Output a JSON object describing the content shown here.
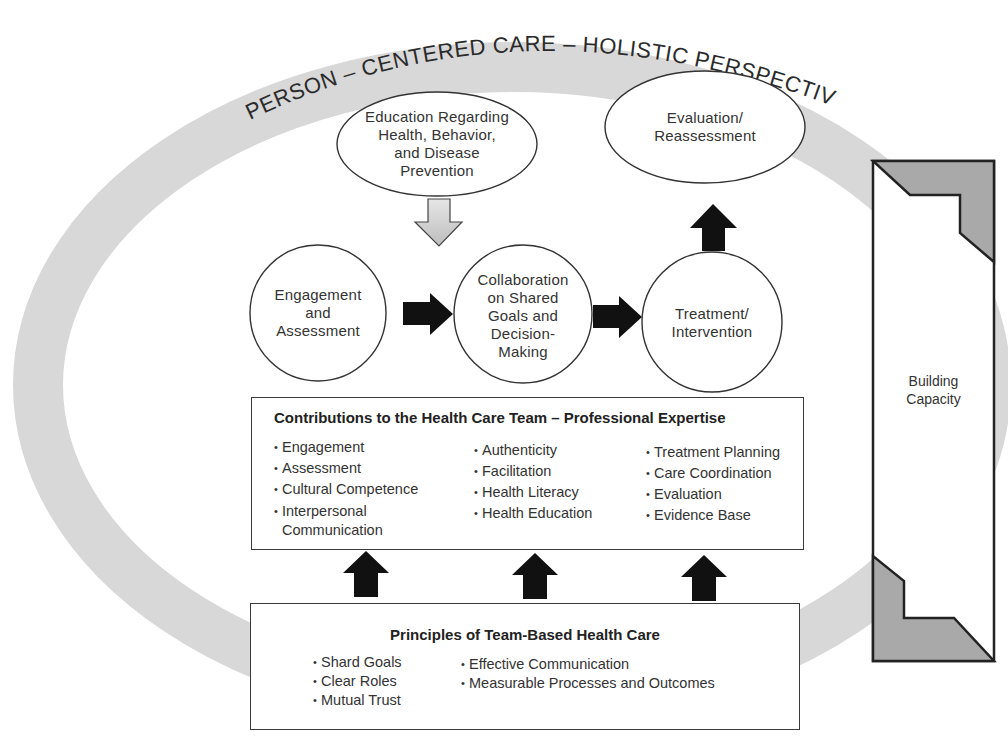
{
  "ring": {
    "label": "PERSON – CENTERED CARE – HOLISTIC PERSPECTIVE",
    "color": "#d6d6d6"
  },
  "nodes": {
    "education": {
      "lines": [
        "Education Regarding",
        "Health, Behavior,",
        "and Disease",
        "Prevention"
      ]
    },
    "evaluation": {
      "lines": [
        "Evaluation/",
        "Reassessment"
      ]
    },
    "engagement": {
      "lines": [
        "Engagement",
        "and",
        "Assessment"
      ]
    },
    "collaboration": {
      "lines": [
        "Collaboration",
        "on Shared",
        "Goals and",
        "Decision-",
        "Making"
      ]
    },
    "treatment": {
      "lines": [
        "Treatment/",
        "Intervention"
      ]
    }
  },
  "contributions": {
    "title": "Contributions to the Health Care Team – Professional Expertise",
    "columns": [
      [
        "Engagement",
        "Assessment",
        "Cultural Competence",
        "Interpersonal",
        "Communication"
      ],
      [
        "Authenticity",
        "Facilitation",
        "Health Literacy",
        "Health Education"
      ],
      [
        "Treatment Planning",
        "Care Coordination",
        "Evaluation",
        "Evidence Base"
      ]
    ]
  },
  "principles": {
    "title": "Principles of Team-Based Health Care",
    "columns": [
      [
        "Shard Goals",
        "Clear Roles",
        "Mutual Trust"
      ],
      [
        "Effective Communication",
        "Measurable Processes and Outcomes"
      ]
    ]
  },
  "capacity": {
    "lines": [
      "Building",
      "Capacity"
    ],
    "fill_color": "#a9a9a9"
  },
  "colors": {
    "arrow_dark": "#111111",
    "arrow_light": "#cfcfcf",
    "outline": "#2e2e2e"
  },
  "bullet": "•"
}
